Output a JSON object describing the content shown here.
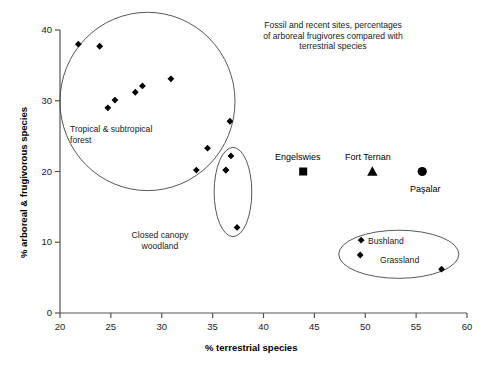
{
  "chart_data": {
    "type": "scatter",
    "title": "Fossil and recent sites, percentages of arboreal frugivores compared with terrestrial species",
    "title_lines": [
      "Fossil and recent sites, percentages",
      "of arboreal frugivores compared with",
      "terrestrial species"
    ],
    "xlabel": "% terrestrial species",
    "ylabel": "% arboreal & frugivorous species",
    "xlim": [
      20,
      60
    ],
    "ylim": [
      0,
      40
    ],
    "xticks": [
      20,
      25,
      30,
      35,
      40,
      45,
      50,
      55,
      60
    ],
    "yticks": [
      0,
      10,
      20,
      30,
      40
    ],
    "grid": false,
    "legend": "none",
    "series": [
      {
        "name": "Tropical & subtropical forest",
        "marker": "diamond",
        "color": "#000000",
        "points": [
          {
            "x": 21.8,
            "y": 38.0
          },
          {
            "x": 23.9,
            "y": 37.7
          },
          {
            "x": 24.7,
            "y": 29.0
          },
          {
            "x": 25.4,
            "y": 30.1
          },
          {
            "x": 27.4,
            "y": 31.2
          },
          {
            "x": 28.1,
            "y": 32.1
          },
          {
            "x": 30.9,
            "y": 33.1
          },
          {
            "x": 36.7,
            "y": 27.1
          },
          {
            "x": 34.5,
            "y": 23.3
          },
          {
            "x": 33.4,
            "y": 20.2
          },
          {
            "x": 36.3,
            "y": 20.2
          }
        ]
      },
      {
        "name": "Closed canopy woodland",
        "marker": "diamond",
        "color": "#000000",
        "points": [
          {
            "x": 36.8,
            "y": 22.2
          },
          {
            "x": 36.3,
            "y": 20.2
          },
          {
            "x": 37.4,
            "y": 12.1
          }
        ]
      },
      {
        "name": "Bushland and Grassland",
        "marker": "diamond",
        "color": "#000000",
        "points": [
          {
            "x": 49.6,
            "y": 10.3
          },
          {
            "x": 49.5,
            "y": 8.2
          },
          {
            "x": 57.5,
            "y": 6.2
          }
        ]
      },
      {
        "name": "Engelswies",
        "marker": "square",
        "color": "#000000",
        "points": [
          {
            "x": 43.9,
            "y": 20.0
          }
        ]
      },
      {
        "name": "Fort Ternan",
        "marker": "triangle",
        "color": "#000000",
        "points": [
          {
            "x": 50.7,
            "y": 20.0
          }
        ]
      },
      {
        "name": "Paşalar",
        "marker": "circle",
        "color": "#000000",
        "points": [
          {
            "x": 55.6,
            "y": 20.0
          }
        ]
      }
    ],
    "annotations": [
      {
        "name": "tropical-forest-group",
        "text": "Tropical & subtropical\nforest",
        "lines": [
          "Tropical & subtropical",
          "forest"
        ]
      },
      {
        "name": "closed-canopy-group",
        "text": "Closed canopy\nwoodland",
        "lines": [
          "Closed canopy",
          "woodland"
        ]
      },
      {
        "name": "bushland-group",
        "text": "Bushland"
      },
      {
        "name": "grassland-group",
        "text": "Grassland"
      },
      {
        "name": "engelswies-site",
        "text": "Engelswies"
      },
      {
        "name": "fort-ternan-site",
        "text": "Fort Ternan"
      },
      {
        "name": "pasalar-site",
        "text": "Paşalar"
      }
    ],
    "enclosures": [
      {
        "name": "tropical-forest-circle",
        "shape": "circle",
        "cx": 28.6,
        "cy": 29.9,
        "rx": 8.6,
        "ry": 12.6
      },
      {
        "name": "closed-canopy-ellipse",
        "shape": "ellipse",
        "cx": 37.0,
        "cy": 17.1,
        "rx": 1.85,
        "ry": 6.3
      },
      {
        "name": "bushland-grassland-ellipse",
        "shape": "ellipse",
        "cx": 53.3,
        "cy": 8.3,
        "rx": 5.9,
        "ry": 3.4
      }
    ]
  },
  "axes": {
    "xlabel": "% terrestrial species",
    "ylabel": "% arboreal & frugivorous species",
    "xtick_labels": [
      "20",
      "25",
      "30",
      "35",
      "40",
      "45",
      "50",
      "55",
      "60"
    ],
    "ytick_labels": [
      "0",
      "10",
      "20",
      "30",
      "40"
    ]
  },
  "title": {
    "line1": "Fossil and recent sites, percentages",
    "line2": "of arboreal frugivores compared with",
    "line3": "terrestrial species"
  },
  "labels": {
    "forest_line1": "Tropical & subtropical",
    "forest_line2": "forest",
    "woodland_line1": "Closed canopy",
    "woodland_line2": "woodland",
    "bushland": "Bushland",
    "grassland": "Grassland",
    "engelswies": "Engelswies",
    "fort_ternan": "Fort Ternan",
    "pasalar": "Paşalar"
  },
  "style": {
    "axis_color": "#555555",
    "marker_color": "#000000",
    "enclosure_color": "#444444",
    "background": "#ffffff"
  }
}
